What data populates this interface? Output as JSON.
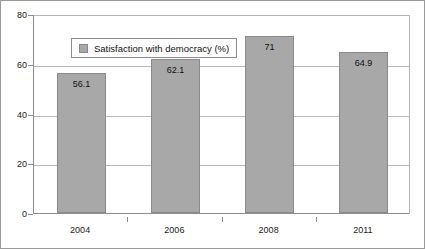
{
  "chart_data": {
    "type": "bar",
    "title": "",
    "subtitle": "",
    "xlabel": "",
    "ylabel": "",
    "categories": [
      "2004",
      "2006",
      "2008",
      "2011"
    ],
    "series": [
      {
        "name": "Satisfaction with democracy (%)",
        "values": [
          56.1,
          62.1,
          71,
          64.9
        ],
        "labels": [
          "56.1",
          "62.1",
          "71",
          "64.9"
        ],
        "color": "#a8a8a8"
      }
    ],
    "ylim": [
      0,
      80
    ],
    "yticks": [
      0,
      20,
      40,
      60,
      80
    ],
    "ytick_labels": [
      "0",
      "20",
      "40",
      "60",
      "80"
    ],
    "grid": "horizontal",
    "legend_position": "top-left-inside"
  },
  "legend": {
    "entries": [
      {
        "label": "Satisfaction with democracy (%)",
        "swatch_color": "#a8a8a8"
      }
    ]
  },
  "colors": {
    "bar_fill": "#a8a8a8",
    "bar_border": "#8a8a8a",
    "gridline": "#b9b9b9",
    "axis": "#8c8c8c",
    "frame": "#9a9a9a",
    "text": "#111111",
    "background": "#ffffff"
  }
}
